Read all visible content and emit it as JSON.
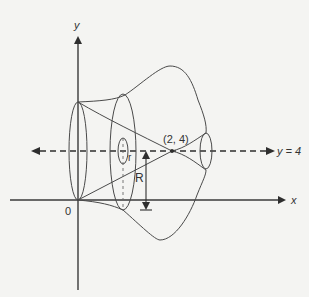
{
  "diagram": {
    "type": "solid-of-revolution",
    "axes": {
      "x_label": "x",
      "y_label": "y",
      "origin_label": "0"
    },
    "axis_of_rotation": {
      "label": "y = 4"
    },
    "point": {
      "label": "(2, 4)"
    },
    "radii": {
      "outer": "R",
      "inner": "r"
    },
    "colors": {
      "stroke": "#3a3a3a",
      "background": "#f4f4f2"
    }
  }
}
